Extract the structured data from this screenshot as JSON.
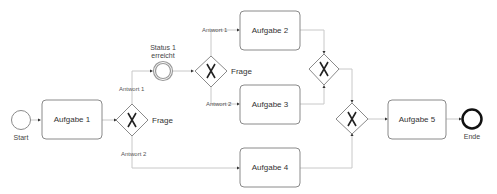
{
  "diagram": {
    "type": "BPMN process",
    "events": {
      "start": {
        "label": "Start"
      },
      "intermediate": {
        "label_line1": "Status 1",
        "label_line2": "erreicht"
      },
      "end": {
        "label": "Ende"
      }
    },
    "tasks": [
      {
        "label": "Aufgabe 1"
      },
      {
        "label": "Aufgabe 2"
      },
      {
        "label": "Aufgabe 3"
      },
      {
        "label": "Aufgabe 4"
      },
      {
        "label": "Aufgabe 5"
      }
    ],
    "gateways": [
      {
        "label": "Frage"
      },
      {
        "label": "Frage"
      }
    ],
    "flow_labels": {
      "g1_answer1": "Antwort 1",
      "g1_answer2": "Antwort 2",
      "g2_answer1": "Antwort 1",
      "g2_answer2": "Antwort 2"
    },
    "colors": {
      "shape_stroke": "#8a8a8a",
      "flow_line": "#c8c8c8",
      "end_event": "#111111",
      "intermediate_event": "#999999"
    }
  }
}
